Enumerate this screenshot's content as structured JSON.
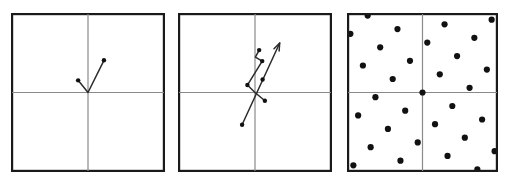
{
  "figure": {
    "title": "",
    "background_color": "#ffffff",
    "panel_count": 3,
    "border_color": "#1a1a1a",
    "axis_color": "#8a8a8a",
    "stroke_color": "#2b2b2b",
    "dot_color": "#111111"
  },
  "chart_data": [
    {
      "type": "scatter",
      "id": "panel-1",
      "title": "",
      "xlabel": "",
      "ylabel": "",
      "xlim": [
        -1,
        1
      ],
      "ylim": [
        -1,
        1
      ],
      "grid": false,
      "legend": "none",
      "axes": {
        "x_axis_y": 0,
        "y_axis_x": 0
      },
      "annotations": [],
      "series": [
        {
          "name": "path",
          "kind": "polyline-with-markers",
          "closed": false,
          "points": [
            {
              "x": -0.13,
              "y": 0.155
            },
            {
              "x": 0.0,
              "y": 0.0
            },
            {
              "x": 0.21,
              "y": 0.41
            }
          ]
        }
      ],
      "markers": [
        {
          "x": -0.13,
          "y": 0.155
        },
        {
          "x": 0.21,
          "y": 0.41
        }
      ]
    },
    {
      "type": "scatter",
      "id": "panel-2",
      "title": "",
      "xlabel": "",
      "ylabel": "",
      "xlim": [
        -1,
        1
      ],
      "ylim": [
        -1,
        1
      ],
      "grid": false,
      "legend": "none",
      "axes": {
        "x_axis_y": 0,
        "y_axis_x": 0
      },
      "annotations": [],
      "series": [
        {
          "name": "zigzag-path",
          "kind": "polyline-with-markers",
          "closed": false,
          "points": [
            {
              "x": 0.055,
              "y": 0.54
            },
            {
              "x": 0.005,
              "y": 0.45
            },
            {
              "x": 0.095,
              "y": 0.4
            },
            {
              "x": -0.1,
              "y": 0.095
            },
            {
              "x": 0.0,
              "y": 0.0
            },
            {
              "x": 0.13,
              "y": -0.105
            }
          ]
        },
        {
          "name": "long-arrow",
          "kind": "arrow",
          "points": [
            {
              "x": -0.17,
              "y": -0.41
            },
            {
              "x": 0.325,
              "y": 0.63
            }
          ]
        }
      ],
      "markers": [
        {
          "x": 0.055,
          "y": 0.54
        },
        {
          "x": 0.095,
          "y": 0.4
        },
        {
          "x": -0.1,
          "y": 0.095
        },
        {
          "x": 0.13,
          "y": -0.105
        },
        {
          "x": -0.17,
          "y": -0.41
        },
        {
          "x": 0.1,
          "y": 0.165
        }
      ]
    },
    {
      "type": "scatter",
      "id": "panel-3",
      "title": "",
      "xlabel": "",
      "ylabel": "",
      "xlim": [
        -1,
        1
      ],
      "ylim": [
        -1,
        1
      ],
      "grid": false,
      "legend": "none",
      "axes": {
        "x_axis_y": 0,
        "y_axis_x": 0
      },
      "annotations": [],
      "lattice": {
        "description": "oblique point lattice of dots on diagonal rows",
        "basis_vector_1": {
          "x": 0.232,
          "y": 0.232
        },
        "basis_vector_2": {
          "x": 0.4,
          "y": -0.172
        },
        "origin": {
          "x": 0,
          "y": 0
        },
        "i_range": [
          -7,
          7
        ],
        "j_range": [
          -7,
          7
        ],
        "dot_radius_px": 3.1
      },
      "series": [
        {
          "name": "lattice-points",
          "kind": "points",
          "generated": true
        }
      ]
    }
  ]
}
